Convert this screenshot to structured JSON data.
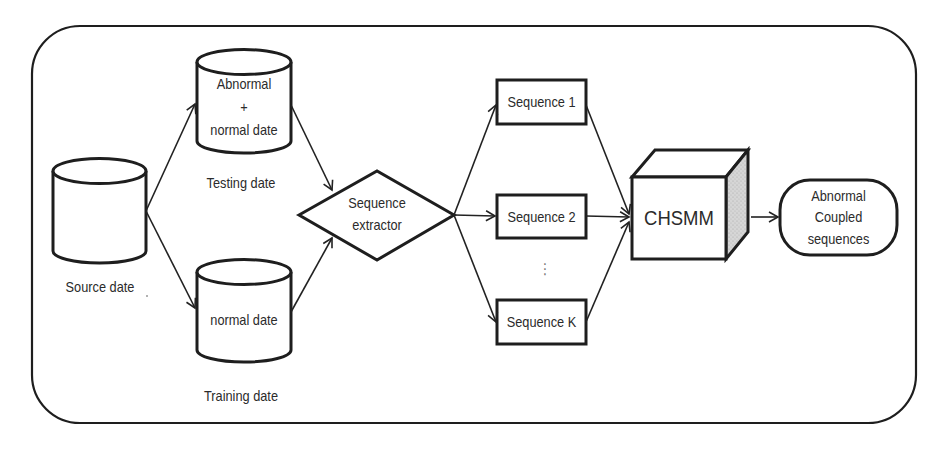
{
  "diagram": {
    "title": "",
    "nodes": {
      "source": {
        "caption": "Source date",
        "shape": "cylinder"
      },
      "testing": {
        "inner_line1": "Abnormal",
        "inner_line2": "+",
        "inner_line3": "normal date",
        "caption": "Testing date",
        "shape": "cylinder"
      },
      "training": {
        "inner": "normal date",
        "caption": "Training date",
        "shape": "cylinder"
      },
      "extractor": {
        "line1": "Sequence",
        "line2": "extractor",
        "shape": "diamond"
      },
      "seq1": {
        "label": "Sequence 1",
        "shape": "rectangle"
      },
      "seq2": {
        "label": "Sequence 2",
        "shape": "rectangle"
      },
      "seq_ellipsis": {
        "label": "⋮"
      },
      "seqk": {
        "label": "Sequence K",
        "shape": "rectangle"
      },
      "chsmm": {
        "label": "CHSMM",
        "shape": "cube"
      },
      "output": {
        "line1": "Abnormal",
        "line2": "Coupled",
        "line3": "sequences",
        "shape": "rounded-pill"
      }
    },
    "edges": [
      {
        "from": "source",
        "to": "testing"
      },
      {
        "from": "source",
        "to": "training"
      },
      {
        "from": "testing",
        "to": "extractor"
      },
      {
        "from": "training",
        "to": "extractor"
      },
      {
        "from": "extractor",
        "to": "seq1"
      },
      {
        "from": "extractor",
        "to": "seq2"
      },
      {
        "from": "extractor",
        "to": "seqk"
      },
      {
        "from": "seq1",
        "to": "chsmm"
      },
      {
        "from": "seq2",
        "to": "chsmm"
      },
      {
        "from": "seqk",
        "to": "chsmm"
      },
      {
        "from": "chsmm",
        "to": "output"
      }
    ],
    "colors": {
      "stroke": "#1e1e1e",
      "cube_side": "#cfcfcf",
      "background": "#ffffff"
    }
  }
}
